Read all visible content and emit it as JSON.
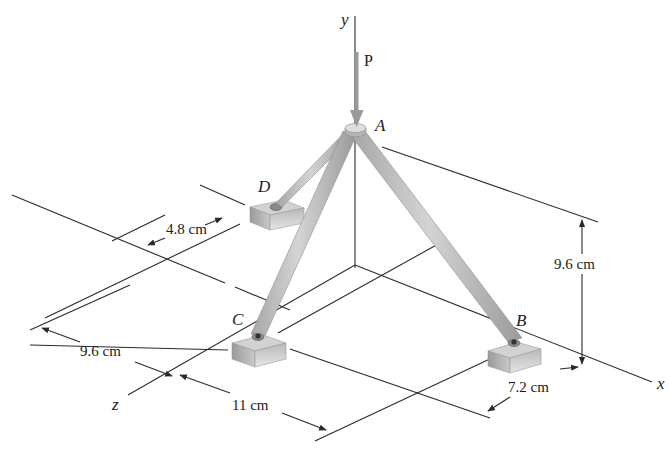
{
  "figure": {
    "background": "#ffffff",
    "colors": {
      "member": "#b9b9b9",
      "member_edge": "#8e8e8e",
      "block_top": "#cfcfcf",
      "block_side": "#a8a8a8",
      "line": "#2a2a2a",
      "load_arrow": "#9a9a9a"
    },
    "axes": {
      "x_label": "x",
      "y_label": "y",
      "z_label": "z"
    },
    "load": {
      "label": "P",
      "direction": "downward"
    },
    "points": {
      "A": "A",
      "B": "B",
      "C": "C",
      "D": "D"
    },
    "dimensions": {
      "height": "9.6 cm",
      "z_offset_left": "9.6 cm",
      "x_span": "11 cm",
      "b_offset": "7.2 cm",
      "d_offset": "4.8 cm"
    }
  }
}
